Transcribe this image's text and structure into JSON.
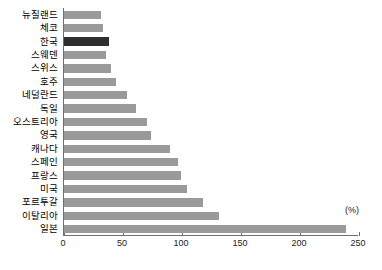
{
  "chart_data": {
    "type": "bar",
    "orientation": "horizontal",
    "title": "",
    "xlabel": "",
    "ylabel": "",
    "unit_label": "(%)",
    "xlim": [
      0,
      250
    ],
    "xticks": [
      0,
      50,
      100,
      150,
      200,
      250
    ],
    "grid": false,
    "highlight_category": "한국",
    "colors": {
      "bar": "#9a9a9a",
      "highlight_bar": "#2e2e2e",
      "axis": "#6f6f6f",
      "text": "#000000"
    },
    "categories": [
      "뉴질랜드",
      "체코",
      "한국",
      "스웨덴",
      "스위스",
      "호주",
      "네덜란드",
      "독일",
      "오스트리아",
      "영국",
      "캐나다",
      "스페인",
      "프랑스",
      "미국",
      "포르투갈",
      "이탈리아",
      "일본"
    ],
    "values": [
      31,
      33,
      38,
      36,
      40,
      44,
      53,
      61,
      70,
      74,
      90,
      97,
      99,
      104,
      118,
      131,
      239
    ]
  }
}
